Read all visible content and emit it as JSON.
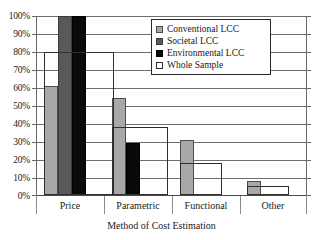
{
  "chart_data": {
    "type": "bar",
    "title": "",
    "xlabel": "Method of Cost Estimation",
    "ylabel": "",
    "ylim": [
      0,
      100
    ],
    "ytick_labels": [
      "100%",
      "90%",
      "80%",
      "70%",
      "60%",
      "50%",
      "40%",
      "30%",
      "20%",
      "10%",
      "0%"
    ],
    "ytick_values": [
      100,
      90,
      80,
      70,
      60,
      50,
      40,
      30,
      20,
      10,
      0
    ],
    "grid": true,
    "legend_position": "top-center-inside",
    "categories": [
      "Price",
      "Parametric",
      "Functional",
      "Other"
    ],
    "series": [
      {
        "name": "Conventional LCC",
        "color": "#a8a8a8",
        "values": [
          61,
          54,
          31,
          8
        ]
      },
      {
        "name": "Societal LCC",
        "color": "#595959",
        "values": [
          100,
          0,
          0,
          0
        ]
      },
      {
        "name": "Environmental LCC",
        "color": "#0a0a0a",
        "values": [
          100,
          29,
          0,
          0
        ]
      },
      {
        "name": "Whole Sample",
        "color": "#ffffff",
        "values": [
          80,
          38,
          18,
          5
        ]
      }
    ]
  },
  "legend": {
    "entries": [
      {
        "label": "Conventional LCC",
        "swatch": "conventional"
      },
      {
        "label": "Societal LCC",
        "swatch": "societal"
      },
      {
        "label": "Environmental LCC",
        "swatch": "environmental"
      },
      {
        "label": "Whole Sample",
        "swatch": "whole"
      }
    ]
  },
  "axes": {
    "y_labels": [
      "100%",
      "90%",
      "80%",
      "70%",
      "60%",
      "50%",
      "40%",
      "30%",
      "20%",
      "10%",
      "0%"
    ],
    "x_labels": [
      "Price",
      "Parametric",
      "Functional",
      "Other"
    ],
    "x_title": "Method of Cost Estimation"
  }
}
